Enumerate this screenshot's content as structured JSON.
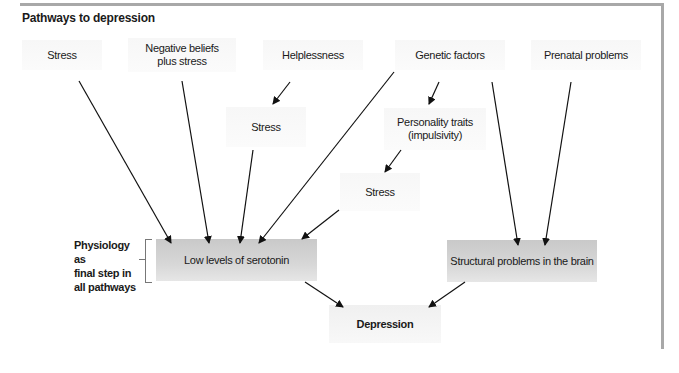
{
  "title": "Pathways to depression",
  "nodes": {
    "stress_top": "Stress",
    "negative_beliefs_1": "Negative beliefs",
    "negative_beliefs_2": "plus stress",
    "helplessness": "Helplessness",
    "genetic_factors": "Genetic factors",
    "prenatal_problems": "Prenatal problems",
    "stress_mid": "Stress",
    "personality_traits_1": "Personality traits",
    "personality_traits_2": "(impulsivity)",
    "stress_low": "Stress",
    "low_serotonin": "Low levels of serotonin",
    "structural_problems": "Structural problems in the brain",
    "depression": "Depression"
  },
  "side_label": {
    "line1": "Physiology as",
    "line2": "final step in",
    "line3": "all pathways"
  },
  "edges": [
    {
      "from": "Stress",
      "to": "Low levels of serotonin"
    },
    {
      "from": "Negative beliefs plus stress",
      "to": "Low levels of serotonin"
    },
    {
      "from": "Helplessness",
      "to": "Stress (mid)"
    },
    {
      "from": "Stress (mid)",
      "to": "Low levels of serotonin"
    },
    {
      "from": "Genetic factors",
      "to": "Low levels of serotonin"
    },
    {
      "from": "Genetic factors",
      "to": "Personality traits (impulsivity)"
    },
    {
      "from": "Personality traits (impulsivity)",
      "to": "Stress (low)"
    },
    {
      "from": "Stress (low)",
      "to": "Low levels of serotonin"
    },
    {
      "from": "Genetic factors",
      "to": "Structural problems in the brain"
    },
    {
      "from": "Prenatal problems",
      "to": "Structural problems in the brain"
    },
    {
      "from": "Low levels of serotonin",
      "to": "Depression"
    },
    {
      "from": "Structural problems in the brain",
      "to": "Depression"
    }
  ],
  "colors": {
    "frame": "#a8a8a8",
    "physiology_box": "#cfcfcf",
    "cause_box": "#f8f8f8",
    "arrow": "#111111"
  }
}
